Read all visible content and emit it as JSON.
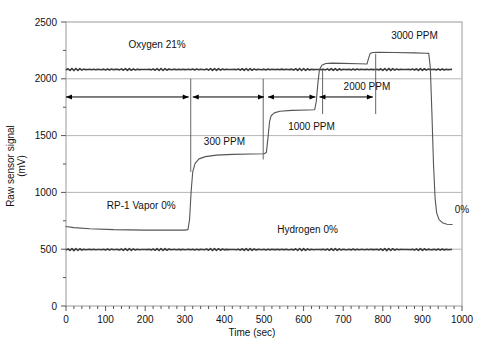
{
  "chart_data": {
    "type": "line",
    "title": "",
    "xlabel": "Time (sec)",
    "ylabel": "Raw sensor signal (mV)",
    "xlim": [
      0,
      1000
    ],
    "ylim": [
      0,
      2500
    ],
    "xticks": [
      0,
      100,
      200,
      300,
      400,
      500,
      600,
      700,
      800,
      900,
      1000
    ],
    "yticks": [
      0,
      500,
      1000,
      1500,
      2000,
      2500
    ],
    "xtick_labels": [
      "0",
      "100",
      "200",
      "300",
      "400",
      "500",
      "600",
      "700",
      "800",
      "900",
      "1000"
    ],
    "ytick_labels": [
      "0",
      "500",
      "1000",
      "1500",
      "2000",
      "2500"
    ],
    "minor_xticks_per_major": 5,
    "minor_yticks_per_major": 2,
    "grid": "horizontal",
    "legend": "none",
    "series": [
      {
        "name": "RP-1 Vapor",
        "label": "RP-1 Vapor 0%",
        "color": "#555555",
        "points": [
          [
            0,
            700
          ],
          [
            20,
            690
          ],
          [
            60,
            680
          ],
          [
            120,
            672
          ],
          [
            200,
            668
          ],
          [
            280,
            668
          ],
          [
            300,
            668
          ],
          [
            308,
            672
          ],
          [
            312,
            760
          ],
          [
            316,
            1010
          ],
          [
            320,
            1180
          ],
          [
            326,
            1255
          ],
          [
            336,
            1295
          ],
          [
            352,
            1315
          ],
          [
            380,
            1328
          ],
          [
            420,
            1335
          ],
          [
            470,
            1338
          ],
          [
            500,
            1340
          ],
          [
            506,
            1352
          ],
          [
            510,
            1480
          ],
          [
            514,
            1620
          ],
          [
            518,
            1675
          ],
          [
            526,
            1700
          ],
          [
            540,
            1715
          ],
          [
            570,
            1722
          ],
          [
            610,
            1726
          ],
          [
            628,
            1728
          ],
          [
            632,
            1800
          ],
          [
            636,
            1960
          ],
          [
            640,
            2080
          ],
          [
            646,
            2120
          ],
          [
            656,
            2135
          ],
          [
            672,
            2138
          ],
          [
            700,
            2136
          ],
          [
            740,
            2132
          ],
          [
            760,
            2130
          ],
          [
            764,
            2180
          ],
          [
            768,
            2222
          ],
          [
            774,
            2232
          ],
          [
            790,
            2234
          ],
          [
            830,
            2232
          ],
          [
            880,
            2228
          ],
          [
            910,
            2225
          ],
          [
            916,
            2224
          ],
          [
            920,
            2100
          ],
          [
            924,
            1700
          ],
          [
            928,
            1250
          ],
          [
            932,
            950
          ],
          [
            936,
            820
          ],
          [
            942,
            760
          ],
          [
            952,
            730
          ],
          [
            962,
            720
          ],
          [
            975,
            718
          ]
        ]
      },
      {
        "name": "Oxygen",
        "label": "Oxygen 21%",
        "color": "#3a3a3a",
        "level": 2082
      },
      {
        "name": "Hydrogen",
        "label": "Hydrogen 0%",
        "color": "#3a3a3a",
        "level": 497
      }
    ],
    "annotations": [
      {
        "name": "oxygen-label",
        "text": "Oxygen 21%",
        "x": 230,
        "y": 2270
      },
      {
        "name": "rp1-label",
        "text": "RP-1 Vapor 0%",
        "x": 190,
        "y": 855
      },
      {
        "name": "hydrogen-label",
        "text": "Hydrogen 0%",
        "x": 610,
        "y": 640
      },
      {
        "name": "conc-300",
        "text": "300 PPM",
        "x": 400,
        "y": 1420
      },
      {
        "name": "conc-1000",
        "text": "1000 PPM",
        "x": 620,
        "y": 1545
      },
      {
        "name": "conc-2000",
        "text": "2000 PPM",
        "x": 760,
        "y": 1900
      },
      {
        "name": "conc-3000",
        "text": "3000 PPM",
        "x": 880,
        "y": 2350
      },
      {
        "name": "conc-zero",
        "text": "0%",
        "x": 1000,
        "y": 820
      }
    ],
    "interval_markers": [
      {
        "name": "interval-baseline",
        "from": 0,
        "to": 310,
        "y": 1840
      },
      {
        "name": "interval-300ppm",
        "from": 320,
        "to": 500,
        "y": 1840
      },
      {
        "name": "interval-1000ppm",
        "from": 510,
        "to": 630,
        "y": 1840
      },
      {
        "name": "interval-2000ppm",
        "from": 640,
        "to": 775,
        "y": 1840
      }
    ],
    "dividers": [
      {
        "name": "divider-300",
        "x": 315,
        "y_from": 1180,
        "y_to": 2000
      },
      {
        "name": "divider-500",
        "x": 498,
        "y_from": 1290,
        "y_to": 2000
      },
      {
        "name": "divider-630",
        "x": 648,
        "y_from": 1690,
        "y_to": 2080
      },
      {
        "name": "divider-780",
        "x": 782,
        "y_from": 1690,
        "y_to": 2220
      }
    ]
  }
}
